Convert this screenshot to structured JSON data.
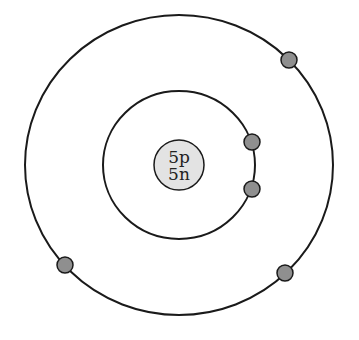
{
  "diagram": {
    "title": "",
    "type": "bohr-model",
    "nucleus": {
      "line1": "5p",
      "line2": "5n",
      "fill": "#e3e3e3",
      "cx": 179,
      "cy": 165,
      "r": 25
    },
    "shells": [
      {
        "name": "inner",
        "cx": 179,
        "cy": 165,
        "rx": 76,
        "ry": 74,
        "electrons": 2
      },
      {
        "name": "outer",
        "cx": 179,
        "cy": 165,
        "rx": 154,
        "ry": 150,
        "electrons": 3
      }
    ],
    "electrons": [
      {
        "shell": "inner",
        "cx": 252,
        "cy": 142
      },
      {
        "shell": "inner",
        "cx": 252,
        "cy": 189
      },
      {
        "shell": "outer",
        "cx": 289,
        "cy": 60
      },
      {
        "shell": "outer",
        "cx": 65,
        "cy": 265
      },
      {
        "shell": "outer",
        "cx": 285,
        "cy": 273
      }
    ],
    "electron_fill": "#8f8f8f",
    "stroke": "#1a1a1a"
  }
}
